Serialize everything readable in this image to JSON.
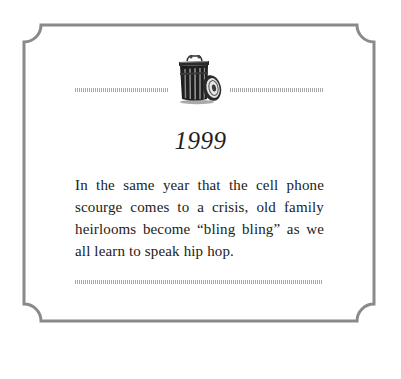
{
  "card": {
    "icon": "trash-can-icon",
    "year": "1999",
    "body": "In the same year that the cell phone scourge comes to a crisis, old family heirlooms become “bling bling” as we all learn to speak hip hop."
  },
  "colors": {
    "frame": "#8a8a8a",
    "rule": "#9a9a9a",
    "text": "#222222",
    "background": "#ffffff"
  }
}
